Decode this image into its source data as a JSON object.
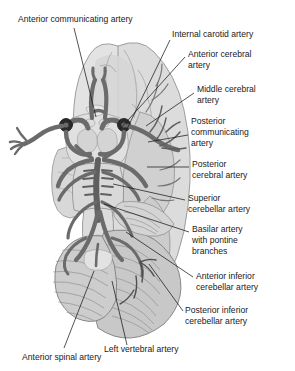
{
  "figure": {
    "view": "inferior view of brain showing the Circle of Willis",
    "background_color": "#ffffff",
    "palette": {
      "artery_fill": "#6f6f6f",
      "artery_stroke": "#3a3a3a",
      "artery_dark": "#4a4a4a",
      "vessel_cut_end": "#2b2b2b",
      "brain_light": "#e6e6e6",
      "brain_mid": "#d2d2d2",
      "brain_dark": "#bdbdbd",
      "cerebellum": "#c4c4c4",
      "brainstem": "#d9d9d9",
      "outline": "#555555",
      "leader_line": "#1a1a1a",
      "text": "#1a1a1a"
    }
  },
  "labels": [
    {
      "id": "anterior-communicating-artery",
      "text": "Anterior communicating artery",
      "x": 18,
      "y": 22,
      "anchor": "start",
      "lines": [
        "Anterior communicating artery"
      ],
      "leader": {
        "x1": 74,
        "y1": 28,
        "x2": 96,
        "y2": 117
      }
    },
    {
      "id": "internal-carotid-artery",
      "text": "Internal carotid artery",
      "x": 172,
      "y": 37,
      "anchor": "start",
      "lines": [
        "Internal carotid artery"
      ],
      "leader": {
        "x1": 170,
        "y1": 40,
        "x2": 126,
        "y2": 131
      }
    },
    {
      "id": "anterior-cerebral-artery",
      "text": "Anterior cerebral artery",
      "x": 188,
      "y": 57,
      "anchor": "start",
      "lines": [
        "Anterior cerebral",
        "artery"
      ],
      "leader": {
        "x1": 185,
        "y1": 57,
        "x2": 120,
        "y2": 129
      }
    },
    {
      "id": "middle-cerebral-artery",
      "text": "Middle cerebral artery",
      "x": 197,
      "y": 92,
      "anchor": "start",
      "lines": [
        "Middle cerebral",
        "artery"
      ],
      "leader": {
        "x1": 194,
        "y1": 93,
        "x2": 146,
        "y2": 126
      }
    },
    {
      "id": "posterior-communicating-artery",
      "text": "Posterior communicating artery",
      "x": 191,
      "y": 124,
      "anchor": "start",
      "lines": [
        "Posterior",
        "communicating",
        "artery"
      ],
      "leader": {
        "x1": 188,
        "y1": 135,
        "x2": 148,
        "y2": 142
      }
    },
    {
      "id": "posterior-cerebral-artery",
      "text": "Posterior cerebral artery",
      "x": 192,
      "y": 167,
      "anchor": "start",
      "lines": [
        "Posterior",
        "cerebral artery"
      ],
      "leader": {
        "x1": 189,
        "y1": 167,
        "x2": 147,
        "y2": 167
      }
    },
    {
      "id": "superior-cerebellar-artery",
      "text": "Superior cerebellar artery",
      "x": 188,
      "y": 201,
      "anchor": "start",
      "lines": [
        "Superior",
        "cerebellar artery"
      ],
      "leader": {
        "x1": 185,
        "y1": 200,
        "x2": 113,
        "y2": 184
      }
    },
    {
      "id": "basilar-artery-with-pontine-branches",
      "text": "Basilar artery with pontine branches",
      "x": 192,
      "y": 232,
      "anchor": "start",
      "lines": [
        "Basilar artery",
        "with pontine",
        "branches"
      ],
      "leader": {
        "x1": 189,
        "y1": 232,
        "x2": 104,
        "y2": 204
      }
    },
    {
      "id": "anterior-inferior-cerebellar-artery",
      "text": "Anterior inferior cerebellar artery",
      "x": 196,
      "y": 279,
      "anchor": "start",
      "lines": [
        "Anterior inferior",
        "cerebellar artery"
      ],
      "leader": {
        "x1": 193,
        "y1": 277,
        "x2": 126,
        "y2": 232
      }
    },
    {
      "id": "posterior-inferior-cerebellar-artery",
      "text": "Posterior inferior cerebellar artery",
      "x": 185,
      "y": 313,
      "anchor": "start",
      "lines": [
        "Posterior inferior",
        "cerebellar artery"
      ],
      "leader": {
        "x1": 183,
        "y1": 311,
        "x2": 149,
        "y2": 264
      }
    },
    {
      "id": "left-vertebral-artery",
      "text": "Left vertebral artery",
      "x": 104,
      "y": 352,
      "anchor": "start",
      "lines": [
        "Left vertebral artery"
      ],
      "leader": {
        "x1": 127,
        "y1": 345,
        "x2": 112,
        "y2": 281
      }
    },
    {
      "id": "anterior-spinal-artery",
      "text": "Anterior spinal artery",
      "x": 22,
      "y": 360,
      "anchor": "start",
      "lines": [
        "Anterior spinal artery"
      ],
      "leader": {
        "x1": 64,
        "y1": 348,
        "x2": 94,
        "y2": 271
      }
    }
  ],
  "structures": [
    {
      "id": "frontal-lobe-left",
      "name": "Left frontal lobe"
    },
    {
      "id": "frontal-lobe-right",
      "name": "Right frontal lobe"
    },
    {
      "id": "temporal-lobe-right",
      "name": "Right temporal lobe"
    },
    {
      "id": "occipital-lobe",
      "name": "Occipital lobe"
    },
    {
      "id": "midbrain",
      "name": "Midbrain"
    },
    {
      "id": "pons",
      "name": "Pons"
    },
    {
      "id": "medulla-oblongata",
      "name": "Medulla oblongata"
    },
    {
      "id": "cerebellum",
      "name": "Cerebellum"
    },
    {
      "id": "spinal-cord-stump",
      "name": "Spinal cord stump"
    },
    {
      "id": "circle-of-willis",
      "name": "Circle of Willis"
    },
    {
      "id": "optic-chiasm",
      "name": "Optic chiasm"
    },
    {
      "id": "mammillary-bodies",
      "name": "Mammillary bodies"
    }
  ]
}
